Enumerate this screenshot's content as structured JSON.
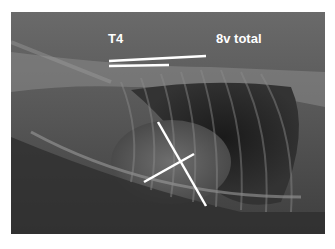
{
  "image": {
    "subject": "lateral thoracic radiograph",
    "annotations": {
      "t4_label": "T4",
      "total_label": "8v total"
    },
    "colors": {
      "annotation": "#ffffff",
      "border": "#ffffff"
    }
  }
}
